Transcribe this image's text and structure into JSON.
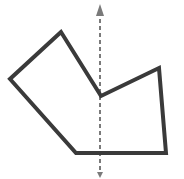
{
  "diagram": {
    "polygon": {
      "points": [
        [
          61,
          32
        ],
        [
          10,
          79
        ],
        [
          76,
          153
        ],
        [
          166,
          153
        ],
        [
          159,
          68
        ],
        [
          101,
          96
        ]
      ],
      "stroke": "#3a3a3a",
      "stroke_width": 4,
      "fill": "none"
    },
    "axis_line": {
      "x": 100,
      "y_start": 12,
      "y_end": 172,
      "stroke": "#7a7a7a",
      "dash": "4,3",
      "arrow_top": true,
      "arrow_bottom": true
    }
  }
}
